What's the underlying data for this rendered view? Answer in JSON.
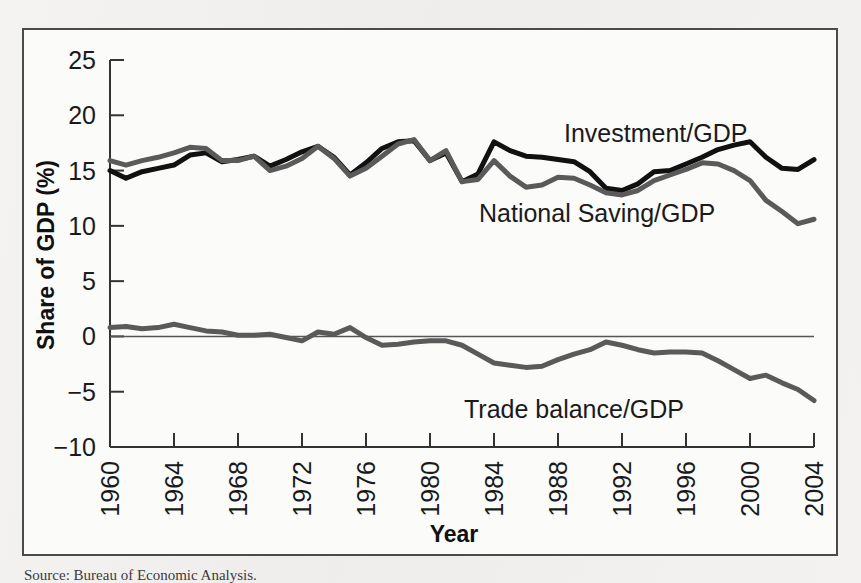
{
  "figure": {
    "background_color": "#fbfbfa",
    "frame_color": "#4a4a4a",
    "page_color": "#f2f1ef"
  },
  "source_note": {
    "text": "Source: Bureau of Economic Analysis."
  },
  "chart_data": {
    "type": "line",
    "title": "",
    "xlabel": "Year",
    "ylabel": "Share of GDP (%)",
    "xlim": [
      1960,
      2004
    ],
    "ylim": [
      -10,
      25
    ],
    "ytick_values": [
      25,
      20,
      15,
      10,
      5,
      0,
      -5,
      -10
    ],
    "ytick_labels": [
      "25",
      "20",
      "15",
      "10",
      "5",
      "0",
      "−5",
      "−10"
    ],
    "xtick_values": [
      1960,
      1964,
      1968,
      1972,
      1976,
      1980,
      1984,
      1988,
      1992,
      1996,
      2000,
      2004
    ],
    "xtick_labels": [
      "1960",
      "1964",
      "1968",
      "1972",
      "1976",
      "1980",
      "1984",
      "1988",
      "1992",
      "1996",
      "2000",
      "2004"
    ],
    "xtick_rotation": 90,
    "grid": false,
    "legend_position": "inline-annotation",
    "zero_line": true,
    "colors": {
      "investment": "#111111",
      "national_saving": "#5a5a5a",
      "trade_balance": "#5a5a5a",
      "zero_line": "#555555"
    },
    "x": [
      1960,
      1961,
      1962,
      1963,
      1964,
      1965,
      1966,
      1967,
      1968,
      1969,
      1970,
      1971,
      1972,
      1973,
      1974,
      1975,
      1976,
      1977,
      1978,
      1979,
      1980,
      1981,
      1982,
      1983,
      1984,
      1985,
      1986,
      1987,
      1988,
      1989,
      1990,
      1991,
      1992,
      1993,
      1994,
      1995,
      1996,
      1997,
      1998,
      1999,
      2000,
      2001,
      2002,
      2003,
      2004
    ],
    "series": [
      {
        "name": "Investment/GDP",
        "label": "Investment/GDP",
        "color": "#111111",
        "linewidth": 5,
        "annotation_at_year": 1986,
        "annotation_value": 19.4,
        "values": [
          15.0,
          14.3,
          14.9,
          15.2,
          15.5,
          16.4,
          16.6,
          15.8,
          16.0,
          16.3,
          15.4,
          16.0,
          16.7,
          17.2,
          16.2,
          14.6,
          15.7,
          17.0,
          17.6,
          17.7,
          15.9,
          16.6,
          14.0,
          14.7,
          17.6,
          16.8,
          16.3,
          16.2,
          16.0,
          15.8,
          14.9,
          13.4,
          13.2,
          13.8,
          14.9,
          15.0,
          15.6,
          16.2,
          16.9,
          17.3,
          17.6,
          16.2,
          15.2,
          15.1,
          16.0
        ]
      },
      {
        "name": "National Saving/GDP",
        "label": "National Saving/GDP",
        "color": "#5a5a5a",
        "linewidth": 5,
        "annotation_at_year": 1988,
        "annotation_value": 11.3,
        "values": [
          15.9,
          15.5,
          15.9,
          16.2,
          16.6,
          17.1,
          17.0,
          15.9,
          15.9,
          16.3,
          15.0,
          15.4,
          16.1,
          17.2,
          16.1,
          14.5,
          15.2,
          16.3,
          17.4,
          17.8,
          15.9,
          16.8,
          14.0,
          14.2,
          15.9,
          14.5,
          13.5,
          13.7,
          14.4,
          14.3,
          13.7,
          13.0,
          12.8,
          13.2,
          14.1,
          14.6,
          15.1,
          15.7,
          15.6,
          15.0,
          14.1,
          12.3,
          11.3,
          10.2,
          10.6
        ]
      },
      {
        "name": "Trade balance/GDP",
        "label": "Trade balance/GDP",
        "color": "#5a5a5a",
        "linewidth": 5,
        "annotation_at_year": 1990,
        "annotation_value": -4.4,
        "values": [
          0.8,
          0.9,
          0.7,
          0.8,
          1.1,
          0.8,
          0.5,
          0.4,
          0.1,
          0.1,
          0.2,
          -0.1,
          -0.4,
          0.4,
          0.2,
          0.8,
          -0.1,
          -0.8,
          -0.7,
          -0.5,
          -0.4,
          -0.4,
          -0.8,
          -1.6,
          -2.4,
          -2.6,
          -2.8,
          -2.7,
          -2.1,
          -1.6,
          -1.2,
          -0.5,
          -0.8,
          -1.2,
          -1.5,
          -1.4,
          -1.4,
          -1.5,
          -2.2,
          -3.0,
          -3.8,
          -3.5,
          -4.2,
          -4.8,
          -5.8
        ]
      }
    ]
  }
}
